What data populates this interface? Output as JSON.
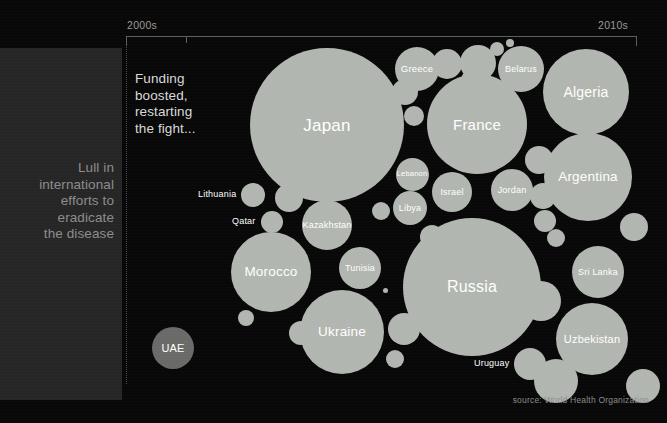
{
  "axis": {
    "left_label": "2000s",
    "right_label": "2010s"
  },
  "side_panel": {
    "text": "Lull in\ninternational\nefforts to\neradicate\nthe disease"
  },
  "annotation": {
    "text": "Funding\nboosted,\nrestarting\nthe fight..."
  },
  "source": {
    "credit": "source: World Health Organization"
  },
  "colors": {
    "background": "#080808",
    "panel": "#262626",
    "bubble": "#b2b6b0",
    "bubble_dim": "#6a6a68",
    "axis": "#5d5d5d",
    "label": "#ffffff",
    "muted_text": "#8d8d8d"
  },
  "chart_data": {
    "type": "bubble",
    "title": "",
    "xlabel": "",
    "ylabel": "",
    "legend": "none",
    "grid": false,
    "x_axis_ticks": [
      "2000s",
      "2010s"
    ],
    "annotations": [
      "Lull in international efforts to eradicate the disease",
      "Funding boosted, restarting the fight..."
    ],
    "source": "World Health Organization",
    "bubbles": [
      {
        "label": "UAE",
        "cx": 173,
        "cy": 348,
        "r": 21,
        "font": 11,
        "label_pos": "inside",
        "dim": true
      },
      {
        "label": "Japan",
        "cx": 327,
        "cy": 125,
        "r": 77,
        "font": 17,
        "label_pos": "inside",
        "dim": false
      },
      {
        "label": "France",
        "cx": 477,
        "cy": 124,
        "r": 50,
        "font": 15,
        "label_pos": "inside",
        "dim": false
      },
      {
        "label": "Russia",
        "cx": 472,
        "cy": 287,
        "r": 69,
        "font": 16,
        "label_pos": "inside",
        "dim": false
      },
      {
        "label": "Algeria",
        "cx": 586,
        "cy": 92,
        "r": 43,
        "font": 14,
        "label_pos": "inside",
        "dim": false
      },
      {
        "label": "Argentina",
        "cx": 588,
        "cy": 177,
        "r": 44,
        "font": 13.5,
        "label_pos": "inside",
        "dim": false
      },
      {
        "label": "Ukraine",
        "cx": 342,
        "cy": 332,
        "r": 42,
        "font": 13.5,
        "label_pos": "inside",
        "dim": false
      },
      {
        "label": "Morocco",
        "cx": 271,
        "cy": 272,
        "r": 40,
        "font": 13.5,
        "label_pos": "inside",
        "dim": false
      },
      {
        "label": "Uzbekistan",
        "cx": 592,
        "cy": 339,
        "r": 36,
        "font": 11,
        "label_pos": "inside",
        "dim": false
      },
      {
        "label": "Greece",
        "cx": 417,
        "cy": 69,
        "r": 22,
        "font": 9.5,
        "label_pos": "inside",
        "dim": false
      },
      {
        "label": "Belarus",
        "cx": 521,
        "cy": 69,
        "r": 23,
        "font": 9,
        "label_pos": "inside",
        "dim": false
      },
      {
        "label": "Sri Lanka",
        "cx": 598,
        "cy": 272,
        "r": 26,
        "font": 9,
        "label_pos": "inside",
        "dim": false
      },
      {
        "label": "Kazakhstan",
        "cx": 327,
        "cy": 225,
        "r": 25,
        "font": 9,
        "label_pos": "inside",
        "dim": false
      },
      {
        "label": "Tunisia",
        "cx": 360,
        "cy": 268,
        "r": 21,
        "font": 9,
        "label_pos": "inside",
        "dim": false
      },
      {
        "label": "Israel",
        "cx": 452,
        "cy": 192,
        "r": 20,
        "font": 9,
        "label_pos": "inside",
        "dim": false
      },
      {
        "label": "Jordan",
        "cx": 512,
        "cy": 190,
        "r": 21,
        "font": 9,
        "label_pos": "inside",
        "dim": false
      },
      {
        "label": "Lebanon",
        "cx": 412,
        "cy": 174,
        "r": 16.5,
        "font": 7.5,
        "label_pos": "inside",
        "dim": false
      },
      {
        "label": "Libya",
        "cx": 410,
        "cy": 208,
        "r": 17,
        "font": 9,
        "label_pos": "inside",
        "dim": false
      },
      {
        "label": "Lithuania",
        "cx": 253,
        "cy": 195,
        "r": 12,
        "font": 9,
        "label_pos": "left",
        "dim": false
      },
      {
        "label": "Qatar",
        "cx": 272,
        "cy": 222,
        "r": 11,
        "font": 9,
        "label_pos": "left",
        "dim": false
      },
      {
        "label": "Uruguay",
        "cx": 530,
        "cy": 364,
        "r": 16,
        "font": 9,
        "label_pos": "left",
        "dim": false
      },
      {
        "label": "",
        "cx": 405,
        "cy": 92,
        "r": 13,
        "font": 0,
        "label_pos": "none",
        "dim": false
      },
      {
        "label": "",
        "cx": 447,
        "cy": 64,
        "r": 15,
        "font": 0,
        "label_pos": "none",
        "dim": false
      },
      {
        "label": "",
        "cx": 478,
        "cy": 63,
        "r": 18,
        "font": 0,
        "label_pos": "none",
        "dim": false
      },
      {
        "label": "",
        "cx": 497,
        "cy": 49,
        "r": 7,
        "font": 0,
        "label_pos": "none",
        "dim": false
      },
      {
        "label": "",
        "cx": 510,
        "cy": 43,
        "r": 4,
        "font": 0,
        "label_pos": "none",
        "dim": false
      },
      {
        "label": "",
        "cx": 466,
        "cy": 77,
        "r": 4,
        "font": 0,
        "label_pos": "none",
        "dim": false
      },
      {
        "label": "",
        "cx": 414,
        "cy": 116,
        "r": 10,
        "font": 0,
        "label_pos": "none",
        "dim": false
      },
      {
        "label": "",
        "cx": 539,
        "cy": 160,
        "r": 14,
        "font": 0,
        "label_pos": "none",
        "dim": false
      },
      {
        "label": "",
        "cx": 543,
        "cy": 196,
        "r": 13,
        "font": 0,
        "label_pos": "none",
        "dim": false
      },
      {
        "label": "",
        "cx": 545,
        "cy": 221,
        "r": 11,
        "font": 0,
        "label_pos": "none",
        "dim": false
      },
      {
        "label": "",
        "cx": 556,
        "cy": 238,
        "r": 9,
        "font": 0,
        "label_pos": "none",
        "dim": false
      },
      {
        "label": "",
        "cx": 541,
        "cy": 301,
        "r": 20,
        "font": 0,
        "label_pos": "none",
        "dim": false
      },
      {
        "label": "",
        "cx": 556,
        "cy": 381,
        "r": 22,
        "font": 0,
        "label_pos": "none",
        "dim": false
      },
      {
        "label": "",
        "cx": 634,
        "cy": 227,
        "r": 14,
        "font": 0,
        "label_pos": "none",
        "dim": false
      },
      {
        "label": "",
        "cx": 643,
        "cy": 386,
        "r": 17,
        "font": 0,
        "label_pos": "none",
        "dim": false
      },
      {
        "label": "",
        "cx": 432,
        "cy": 237,
        "r": 12,
        "font": 0,
        "label_pos": "none",
        "dim": false
      },
      {
        "label": "",
        "cx": 404,
        "cy": 329,
        "r": 16,
        "font": 0,
        "label_pos": "none",
        "dim": false
      },
      {
        "label": "",
        "cx": 395,
        "cy": 359,
        "r": 9,
        "font": 0,
        "label_pos": "none",
        "dim": false
      },
      {
        "label": "",
        "cx": 381,
        "cy": 211,
        "r": 9,
        "font": 0,
        "label_pos": "none",
        "dim": false
      },
      {
        "label": "",
        "cx": 385,
        "cy": 290,
        "r": 2.5,
        "font": 0,
        "label_pos": "none",
        "dim": false
      },
      {
        "label": "",
        "cx": 289,
        "cy": 198,
        "r": 14,
        "font": 0,
        "label_pos": "none",
        "dim": false
      },
      {
        "label": "",
        "cx": 301,
        "cy": 333,
        "r": 12,
        "font": 0,
        "label_pos": "none",
        "dim": false
      },
      {
        "label": "",
        "cx": 246,
        "cy": 318,
        "r": 8,
        "font": 0,
        "label_pos": "none",
        "dim": false
      },
      {
        "label": "",
        "cx": 392,
        "cy": 133,
        "r": 6,
        "font": 0,
        "label_pos": "none",
        "dim": false
      }
    ]
  }
}
